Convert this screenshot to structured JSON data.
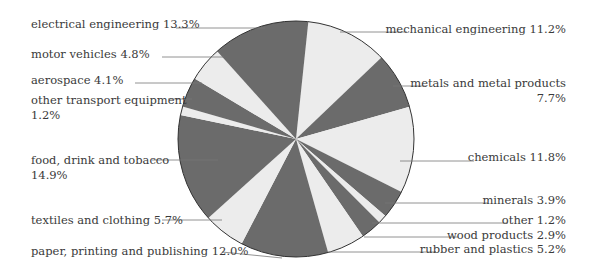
{
  "chart_data": {
    "type": "pie",
    "title": "",
    "start_angle_deg": 6,
    "direction": "clockwise",
    "colors": {
      "dark": "#6b6b6b",
      "light": "#ececec",
      "outline": "#333333",
      "leader": "#777777"
    },
    "slices": [
      {
        "label": "mechanical engineering",
        "value": 11.2,
        "text": "mechanical engineering 11.2%",
        "shade": "light"
      },
      {
        "label": "metals and metal products",
        "value": 7.7,
        "text": "metals and metal products",
        "text2": "7.7%",
        "shade": "dark"
      },
      {
        "label": "chemicals",
        "value": 11.8,
        "text": "chemicals 11.8%",
        "shade": "light"
      },
      {
        "label": "minerals",
        "value": 3.9,
        "text": "minerals 3.9%",
        "shade": "dark"
      },
      {
        "label": "other",
        "value": 1.2,
        "text": "other 1.2%",
        "shade": "light"
      },
      {
        "label": "wood products",
        "value": 2.9,
        "text": "wood products 2.9%",
        "shade": "dark"
      },
      {
        "label": "rubber and plastics",
        "value": 5.2,
        "text": "rubber and plastics 5.2%",
        "shade": "light"
      },
      {
        "label": "paper, printing and publishing",
        "value": 12.0,
        "text": "paper, printing and publishing 12.0%",
        "shade": "dark"
      },
      {
        "label": "textiles and clothing",
        "value": 5.7,
        "text": "textiles and clothing 5.7%",
        "shade": "light"
      },
      {
        "label": "food, drink and tobacco",
        "value": 14.9,
        "text": "food, drink and tobacco",
        "text2": "14.9%",
        "shade": "dark"
      },
      {
        "label": "other transport equipment",
        "value": 1.2,
        "text": "other transport equipment",
        "text2": "1.2%",
        "shade": "light"
      },
      {
        "label": "aerospace",
        "value": 4.1,
        "text": "aerospace 4.1%",
        "shade": "dark"
      },
      {
        "label": "motor vehicles",
        "value": 4.8,
        "text": "motor vehicles 4.8%",
        "shade": "light"
      },
      {
        "label": "electrical engineering",
        "value": 13.3,
        "text": "electrical engineering 13.3%",
        "shade": "dark"
      }
    ],
    "legend": "none (leader-line labels)"
  }
}
